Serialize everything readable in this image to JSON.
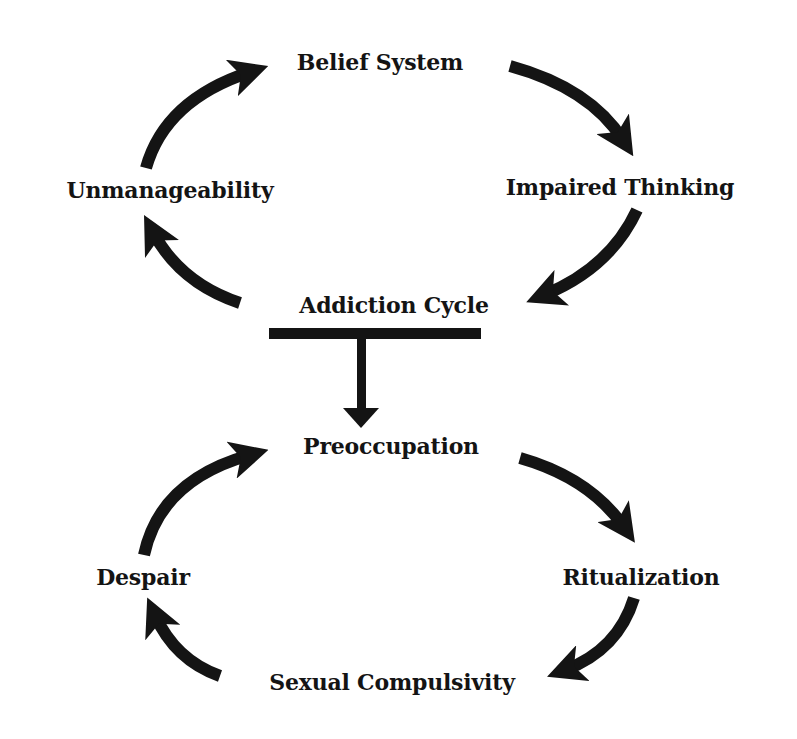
{
  "diagram": {
    "colors": {
      "background": "#ffffff",
      "ink": "#141414"
    },
    "top_cycle": {
      "nodes": {
        "belief_system": "Belief System",
        "impaired_thinking": "Impaired Thinking",
        "addiction_cycle": "Addiction Cycle",
        "unmanageability": "Unmanageability"
      },
      "flow": [
        "Belief System",
        "Impaired Thinking",
        "Addiction Cycle",
        "Unmanageability",
        "Belief System"
      ]
    },
    "connector": {
      "from": "Addiction Cycle",
      "to": "Preoccupation",
      "shape": "t-bar-down-arrow"
    },
    "bottom_cycle": {
      "nodes": {
        "preoccupation": "Preoccupation",
        "ritualization": "Ritualization",
        "sexual_compulsivity": "Sexual Compulsivity",
        "despair": "Despair"
      },
      "flow": [
        "Preoccupation",
        "Ritualization",
        "Sexual Compulsivity",
        "Despair",
        "Preoccupation"
      ]
    }
  }
}
